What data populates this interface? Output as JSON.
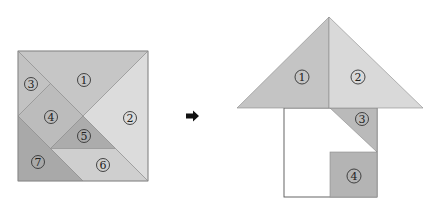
{
  "colors": {
    "piece_1": "#c6c6c6",
    "piece_2": "#dcdcdc",
    "piece_3": "#c2c2c2",
    "piece_4": "#bcbcbc",
    "piece_5": "#acacac",
    "piece_6": "#cfcfcf",
    "piece_7": "#a9a9a9",
    "house_1": "#c4c4c4",
    "house_2": "#d9d9d9",
    "house_3": "#bababa",
    "house_4": "#b4b4b4",
    "outline": "#8a8a8a",
    "arrow": "#111111"
  },
  "tangram_square": {
    "pieces": [
      {
        "id": "1",
        "label": "1",
        "shape": "large-triangle"
      },
      {
        "id": "2",
        "label": "2",
        "shape": "large-triangle"
      },
      {
        "id": "3",
        "label": "3",
        "shape": "small-triangle"
      },
      {
        "id": "4",
        "label": "4",
        "shape": "square"
      },
      {
        "id": "5",
        "label": "5",
        "shape": "small-triangle"
      },
      {
        "id": "6",
        "label": "6",
        "shape": "parallelogram"
      },
      {
        "id": "7",
        "label": "7",
        "shape": "medium-triangle"
      }
    ]
  },
  "arrow": {
    "icon": "right-arrow-icon"
  },
  "house": {
    "pieces": [
      {
        "id": "1",
        "label": "1",
        "role": "roof-left"
      },
      {
        "id": "2",
        "label": "2",
        "role": "roof-right"
      },
      {
        "id": "3",
        "label": "3",
        "role": "wall-triangle"
      },
      {
        "id": "4",
        "label": "4",
        "role": "door-square"
      }
    ],
    "blank_region": "empty outlined body"
  }
}
